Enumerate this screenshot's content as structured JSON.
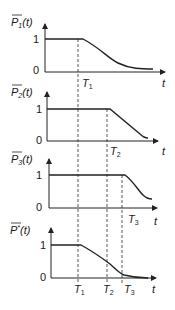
{
  "figure": {
    "panels": [
      {
        "id": "p1",
        "ylabel_base": "P",
        "ylabel_sub": "1",
        "ylabel_sup": "",
        "ylabel_arg": "(t)",
        "ytick_high": "1",
        "ytick_low": "0",
        "xlabel": "t",
        "drop_at": "T1",
        "shape": "gradual-decay"
      },
      {
        "id": "p2",
        "ylabel_base": "P",
        "ylabel_sub": "2",
        "ylabel_sup": "",
        "ylabel_arg": "(t)",
        "ytick_high": "1",
        "ytick_low": "0",
        "xlabel": "t",
        "drop_at": "T2",
        "shape": "linear-decay"
      },
      {
        "id": "p3",
        "ylabel_base": "P",
        "ylabel_sub": "3",
        "ylabel_sup": "",
        "ylabel_arg": "(t)",
        "ytick_high": "1",
        "ytick_low": "0",
        "xlabel": "t",
        "drop_at": "T3",
        "shape": "steep-decay"
      },
      {
        "id": "p4",
        "ylabel_base": "P",
        "ylabel_sub": "",
        "ylabel_sup": "*",
        "ylabel_arg": "(t)",
        "ytick_high": "1",
        "ytick_low": "0",
        "xlabel": "t",
        "drop_at": "T1",
        "shape": "combined-decay"
      }
    ],
    "time_markers": [
      {
        "base": "T",
        "sub": "1"
      },
      {
        "base": "T",
        "sub": "2"
      },
      {
        "base": "T",
        "sub": "3"
      }
    ]
  }
}
